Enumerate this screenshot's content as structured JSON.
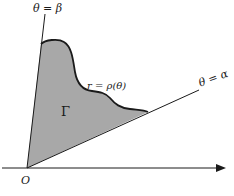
{
  "diagram": {
    "colors": {
      "region_fill": "#a8a8a8",
      "stroke": "#1a1a1a",
      "background": "#ffffff"
    },
    "labels": {
      "ray_beta": "θ = β",
      "ray_alpha": "θ = α",
      "curve": "r = ρ(θ)",
      "region": "Γ",
      "origin": "O"
    },
    "elements": {
      "horizontal_axis": "polar axis with arrow pointing right",
      "ray_beta": "ray from origin at angle β",
      "ray_alpha": "ray from origin at angle α",
      "curve": "boundary curve r = ρ(θ) between the rays",
      "region": "shaded region Γ bounded by the two rays and the curve"
    }
  }
}
